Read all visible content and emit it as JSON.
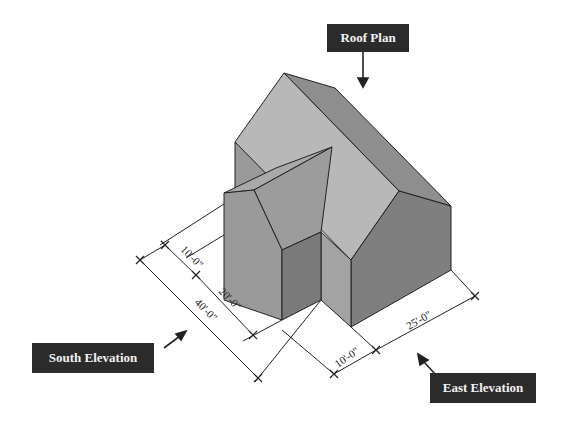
{
  "diagram": {
    "type": "isometric-house",
    "labels": {
      "roof_plan": "Roof Plan",
      "south_elevation": "South Elevation",
      "east_elevation": "East Elevation"
    },
    "dimensions": {
      "wing_depth": "10'-0\"",
      "main_depth_offset": "20'-0\"",
      "overall_south": "40'-0\"",
      "wing_east": "10'-0\"",
      "main_east": "25'-0\""
    },
    "colors": {
      "roof_light": "#b5b5b5",
      "roof_dark": "#8c8c8c",
      "wall_mid": "#9c9c9c",
      "wall_dark": "#7e7e7e",
      "label_bg": "#2b2b2b",
      "label_text": "#f2f2f2",
      "line": "#222222"
    }
  }
}
